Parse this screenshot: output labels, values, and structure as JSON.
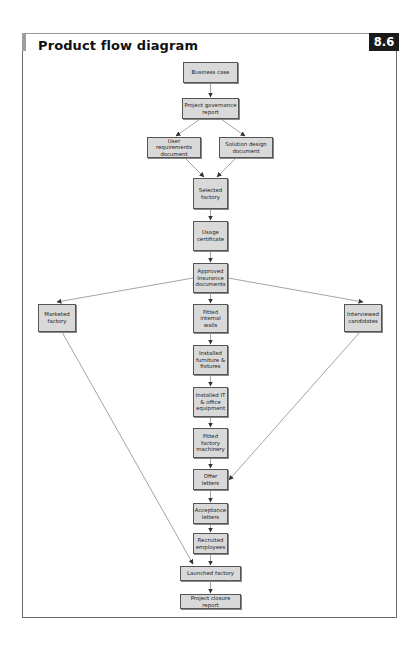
{
  "header": {
    "title": "Product flow diagram",
    "figure_number": "8.6"
  },
  "colors": {
    "node_fill": "#d9d9d9",
    "node_border": "#555555",
    "badge_bg": "#1a1a1a",
    "badge_text": "#ffffff",
    "edge": "#666666"
  },
  "nodes": {
    "business_case": "Business case",
    "project_governance_report": "Project governance report",
    "user_requirements_document": "User requirements document",
    "solution_design_document": "Solution design document",
    "selected_factory": "Selected factory",
    "usage_certificate": "Usage certificate",
    "approved_insurance_documents": "Approved Insurance documents",
    "marketed_factory": "Marketed factory",
    "interviewed_candidates": "Interviewed candidates",
    "fitted_internal_walls": "Fitted internal walls",
    "installed_furniture_fixtures": "Installed furniture & fixtures",
    "installed_it_office_equipment": "Installed IT & office equipment",
    "fitted_factory_machinery": "Fitted factory machinery",
    "offer_letters": "Offer letters",
    "acceptance_letters": "Acceptance letters",
    "recruited_employees": "Recruited employees",
    "launched_factory": "Launched factory",
    "project_closure_report": "Project closure report"
  },
  "edges": [
    [
      "business_case",
      "project_governance_report"
    ],
    [
      "project_governance_report",
      "user_requirements_document"
    ],
    [
      "project_governance_report",
      "solution_design_document"
    ],
    [
      "user_requirements_document",
      "selected_factory"
    ],
    [
      "solution_design_document",
      "selected_factory"
    ],
    [
      "selected_factory",
      "usage_certificate"
    ],
    [
      "usage_certificate",
      "approved_insurance_documents"
    ],
    [
      "approved_insurance_documents",
      "marketed_factory"
    ],
    [
      "approved_insurance_documents",
      "interviewed_candidates"
    ],
    [
      "approved_insurance_documents",
      "fitted_internal_walls"
    ],
    [
      "fitted_internal_walls",
      "installed_furniture_fixtures"
    ],
    [
      "installed_furniture_fixtures",
      "installed_it_office_equipment"
    ],
    [
      "installed_it_office_equipment",
      "fitted_factory_machinery"
    ],
    [
      "fitted_factory_machinery",
      "offer_letters"
    ],
    [
      "interviewed_candidates",
      "offer_letters"
    ],
    [
      "offer_letters",
      "acceptance_letters"
    ],
    [
      "acceptance_letters",
      "recruited_employees"
    ],
    [
      "recruited_employees",
      "launched_factory"
    ],
    [
      "marketed_factory",
      "launched_factory"
    ],
    [
      "launched_factory",
      "project_closure_report"
    ]
  ]
}
